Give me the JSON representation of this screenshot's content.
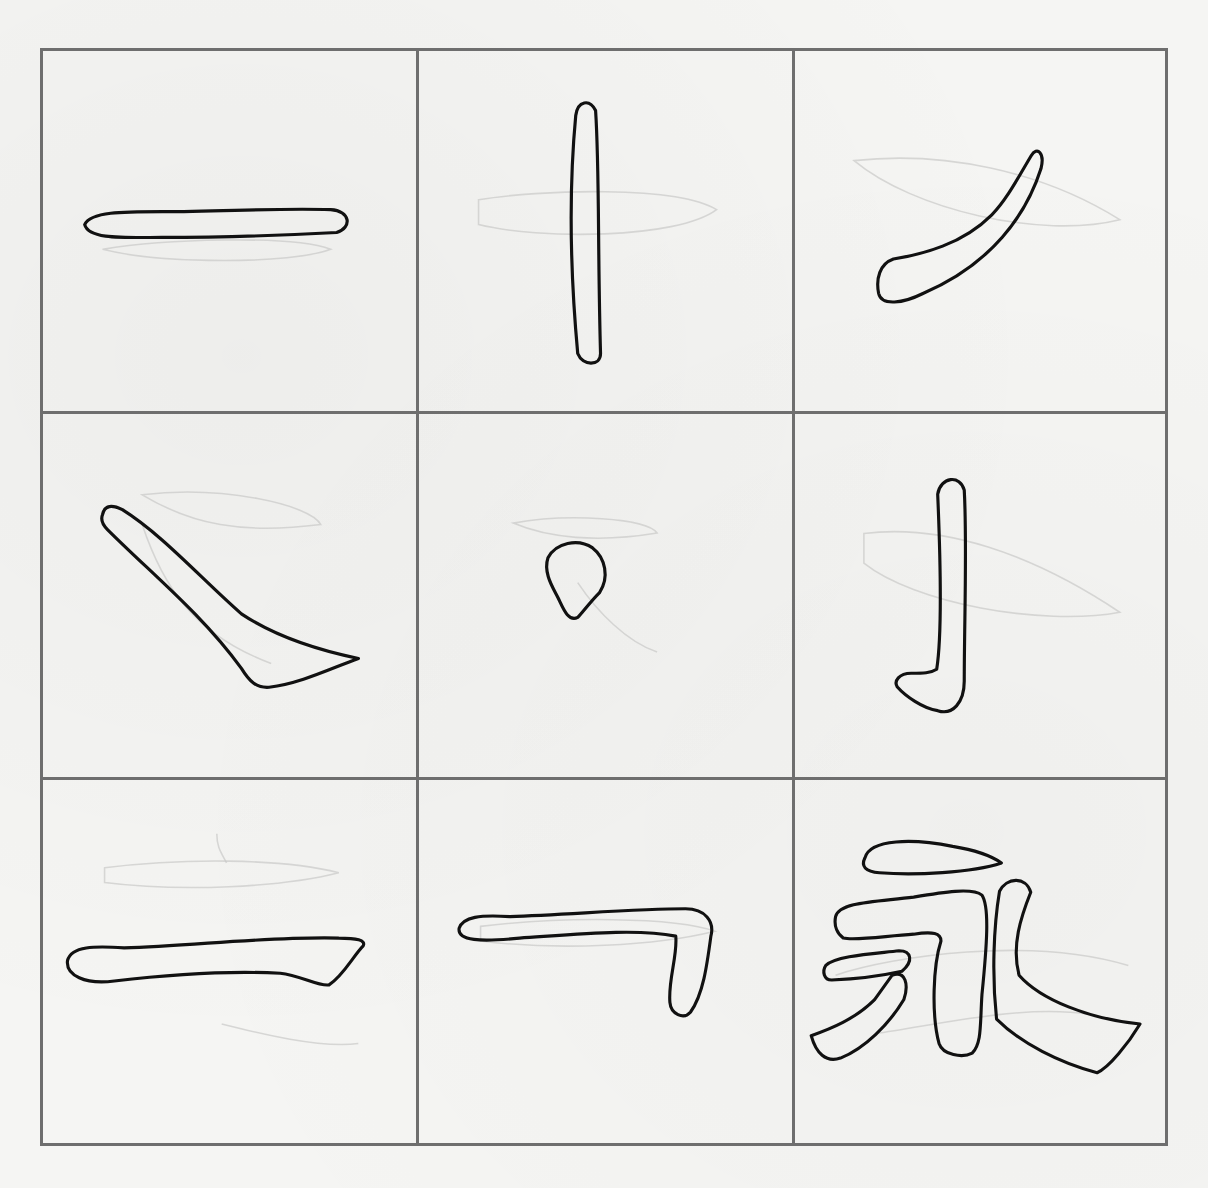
{
  "sheet": {
    "title": "",
    "grid": {
      "rows": 3,
      "cols": 3,
      "line_color": "#6e6e6e",
      "paper_color": "#f5f5f3",
      "ink_color": "#111111"
    },
    "cells": [
      {
        "id": 1,
        "stroke": "横",
        "label": "heng-horizontal"
      },
      {
        "id": 2,
        "stroke": "竖",
        "label": "shu-vertical"
      },
      {
        "id": 3,
        "stroke": "撇",
        "label": "pie-short-left-falling"
      },
      {
        "id": 4,
        "stroke": "捺",
        "label": "na-right-falling"
      },
      {
        "id": 5,
        "stroke": "点",
        "label": "dian-dot"
      },
      {
        "id": 6,
        "stroke": "竖钩",
        "label": "shu-gou-vertical-hook"
      },
      {
        "id": 7,
        "stroke": "横",
        "label": "heng-long-horizontal"
      },
      {
        "id": 8,
        "stroke": "横折",
        "label": "heng-zhe-horizontal-turn"
      },
      {
        "id": 9,
        "stroke": "永",
        "label": "yong-character"
      }
    ]
  }
}
